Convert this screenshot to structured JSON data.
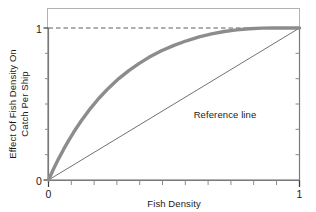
{
  "chart_data": {
    "type": "line",
    "title": "",
    "subtitle": "",
    "xlabel": "Fish Density",
    "ylabel_line1": "Effect Of Fish Density On",
    "ylabel_line2": "Catch Per Ship",
    "ylabel": "Effect Of Fish Density On Catch Per Ship",
    "xlim": [
      0,
      1
    ],
    "ylim": [
      0,
      1
    ],
    "xticks": [
      0,
      1
    ],
    "yticks": [
      0,
      1
    ],
    "xtick_labels": [
      "0",
      "1"
    ],
    "ytick_labels": [
      "0",
      "1"
    ],
    "x_minor_tick_count": 11,
    "y_minor_tick_count": 5,
    "grid": false,
    "legend": "none",
    "annotations": [
      {
        "name": "reference-line-label",
        "text": "Reference line",
        "x": 0.66,
        "y": 0.39
      }
    ],
    "series": [
      {
        "name": "saturating-response",
        "style": "thick-gray-curve",
        "color": "#8c8c8c",
        "width": 3.4,
        "x": [
          0,
          0.02,
          0.04,
          0.06,
          0.08,
          0.1,
          0.13,
          0.16,
          0.2,
          0.24,
          0.28,
          0.32,
          0.36,
          0.4,
          0.45,
          0.5,
          0.55,
          0.6,
          0.65,
          0.7,
          0.75,
          0.8,
          0.85,
          0.9,
          0.95,
          1
        ],
        "y": [
          0,
          0.072,
          0.139,
          0.201,
          0.259,
          0.314,
          0.388,
          0.456,
          0.536,
          0.606,
          0.667,
          0.72,
          0.766,
          0.807,
          0.85,
          0.886,
          0.916,
          0.941,
          0.961,
          0.977,
          0.988,
          0.995,
          0.999,
          1.0,
          1.0,
          1.0
        ]
      },
      {
        "name": "reference-line",
        "style": "thin-line",
        "color": "#4d4d4d",
        "width": 0.8,
        "x": [
          0,
          1
        ],
        "y": [
          0,
          1
        ]
      },
      {
        "name": "asymptote-line",
        "style": "dashed",
        "color": "#4d4d4d",
        "width": 0.9,
        "x": [
          0,
          1
        ],
        "y": [
          1,
          1
        ]
      }
    ],
    "frame": {
      "color": "#b3b3b3",
      "visible": true
    },
    "axis_color": "#808080"
  }
}
